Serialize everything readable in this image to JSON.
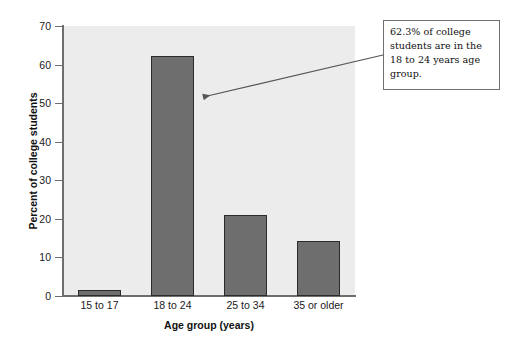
{
  "chart_data": {
    "type": "bar",
    "title": "",
    "subtitle": "",
    "xlabel": "Age group (years)",
    "ylabel": "Percent of college students",
    "categories": [
      "15 to 17",
      "18 to 24",
      "25 to 34",
      "35 or older"
    ],
    "values": [
      1.6,
      62.3,
      21.0,
      14.3
    ],
    "ylim": [
      0,
      70
    ],
    "ytick_values": [
      0,
      10,
      20,
      30,
      40,
      50,
      60,
      70
    ],
    "ytick_labels": [
      "0",
      "10",
      "20",
      "30",
      "40",
      "50",
      "60",
      "70"
    ],
    "grid": false,
    "legend": null,
    "legend_position": "none",
    "annotations": [
      {
        "text": "62.3% of college students are in the 18 to 24 years  age group.",
        "points_to_category": "18 to 24",
        "points_to_value": 52
      }
    ],
    "colors": {
      "bar_fill": "#6e6e6e",
      "bar_border": "#2b2b2b",
      "plot_background": "#ececec",
      "figure_background": "#ffffff",
      "axis_line": "#6e6e6e",
      "text": "#111111",
      "annotation_border": "#707070",
      "annotation_background": "#ffffff",
      "leader_line": "#555555"
    }
  }
}
